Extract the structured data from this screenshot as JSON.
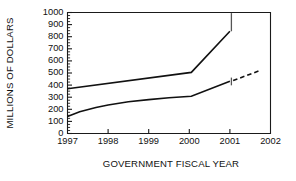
{
  "chart_data": {
    "type": "line",
    "title": "",
    "xlabel": "GOVERNMENT FISCAL YEAR",
    "ylabel": "MILLIONS OF DOLLARS",
    "xlim": [
      1997,
      2002
    ],
    "ylim": [
      0,
      1000
    ],
    "grid": false,
    "legend": "none",
    "x_ticks": [
      "1997",
      "1998",
      "1999",
      "2000",
      "2001",
      "2002"
    ],
    "y_ticks": [
      "0",
      "100",
      "200",
      "300",
      "400",
      "500",
      "600",
      "700",
      "800",
      "900",
      "1000"
    ],
    "y_minor_step": 25,
    "series": [
      {
        "name": "upper",
        "style": "solid",
        "points": [
          {
            "x": 1997.0,
            "y": 370
          },
          {
            "x": 2000.05,
            "y": 505
          },
          {
            "x": 2001.0,
            "y": 845
          }
        ],
        "error_bars": [
          {
            "x": 2001.0,
            "low": 845,
            "high": 995
          }
        ]
      },
      {
        "name": "lower",
        "style": "solid",
        "points": [
          {
            "x": 1997.0,
            "y": 140
          },
          {
            "x": 1997.3,
            "y": 180
          },
          {
            "x": 1997.7,
            "y": 215
          },
          {
            "x": 1998.0,
            "y": 235
          },
          {
            "x": 1998.5,
            "y": 262
          },
          {
            "x": 1999.0,
            "y": 280
          },
          {
            "x": 1999.5,
            "y": 295
          },
          {
            "x": 2000.05,
            "y": 308
          },
          {
            "x": 2001.0,
            "y": 432
          }
        ],
        "error_bars": [
          {
            "x": 2001.0,
            "low": 398,
            "high": 462
          }
        ]
      },
      {
        "name": "lower-projection",
        "style": "dashed",
        "points": [
          {
            "x": 2001.08,
            "y": 438
          },
          {
            "x": 2001.72,
            "y": 518
          }
        ]
      }
    ]
  },
  "labels": {
    "y_axis_title": "MILLIONS OF DOLLARS",
    "x_axis_title": "GOVERNMENT FISCAL YEAR"
  }
}
